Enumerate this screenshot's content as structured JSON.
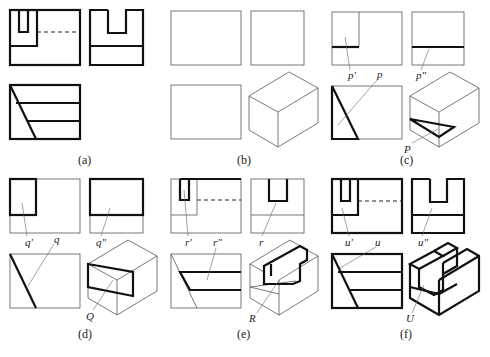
{
  "figure": {
    "panels": [
      {
        "id": "a",
        "caption": "(a)",
        "labels": []
      },
      {
        "id": "b",
        "caption": "(b)",
        "labels": []
      },
      {
        "id": "c",
        "caption": "(c)",
        "labels": [
          "p'",
          "p",
          "p\"",
          "P"
        ]
      },
      {
        "id": "d",
        "caption": "(d)",
        "labels": [
          "q'",
          "q",
          "q\"",
          "Q"
        ]
      },
      {
        "id": "e",
        "caption": "(e)",
        "labels": [
          "r'",
          "r\"",
          "r",
          "R"
        ]
      },
      {
        "id": "f",
        "caption": "(f)",
        "labels": [
          "u'",
          "u",
          "u\"",
          "U"
        ]
      }
    ]
  },
  "colors": {
    "line": "#111111",
    "thin_line": "#555555",
    "background": "#ffffff"
  }
}
